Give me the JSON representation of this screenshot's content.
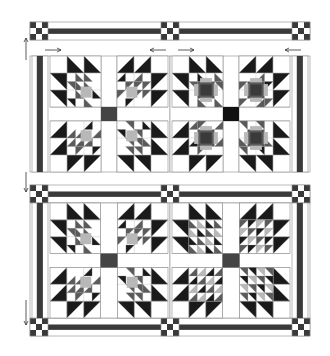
{
  "diagram": {
    "type": "quilt-layout",
    "colors": {
      "background": "#ffffff",
      "outline": "#8a8a8a",
      "dark": "#1a1a1a",
      "sash_dark": "#3a3a3a",
      "medium": "#5a5a5a",
      "light": "#b8b8b8",
      "center_square": "#444444",
      "center_square_alt": "#111111"
    },
    "top_strip": {
      "cornerstones": [
        "nine-patch",
        "nine-patch",
        "nine-patch"
      ]
    },
    "panels": [
      {
        "id": "panel-top-left",
        "block_style": "bear-paw-light-center",
        "center_square": "center_square"
      },
      {
        "id": "panel-top-right",
        "block_style": "bear-paw-framed-center",
        "center_square": "center_square_alt"
      },
      {
        "id": "panel-bottom-left",
        "block_style": "bear-paw-light-center",
        "center_square": "center_square"
      },
      {
        "id": "panel-bottom-right",
        "block_style": "bear-paw-pieced-center",
        "center_square": "center_square"
      }
    ],
    "blocks_per_panel": 4,
    "annotations": {
      "horizontal_arrows": [
        "right",
        "left",
        "right",
        "left"
      ],
      "vertical_arrows": [
        "up",
        "down",
        "down"
      ]
    }
  }
}
